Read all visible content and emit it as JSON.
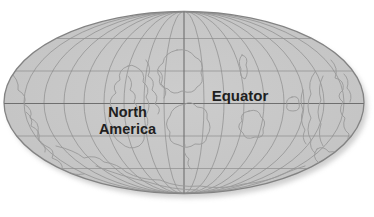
{
  "map": {
    "kind": "elliptical-projection-world-map",
    "labels": {
      "north_america_line1": "North",
      "north_america_line2": "America",
      "equator": "Equator"
    }
  },
  "colors": {
    "background": "#ffffff",
    "ocean_fill_center": "#cccccc",
    "ocean_fill_edge": "#c3c3c3",
    "edge_stroke": "#838383",
    "grid_line": "#8d8d8d",
    "grid_major": "#6f6f6f",
    "coastline": "#9a9a9a",
    "label_text": "#1f1f1f",
    "shadow": "#a8a8a8"
  },
  "geometry": {
    "width": 374,
    "height": 217,
    "cx": 184,
    "cy": 102.5,
    "rx": 180,
    "ry": 91,
    "equator_y": 103.5,
    "central_meridian_x": 184,
    "parallels_y": [
      38.5,
      71,
      136,
      168.5
    ],
    "meridians_per_side": 8,
    "shadow_dx": 3.5,
    "shadow_dy": 4.5
  },
  "coastlines": [
    {
      "name": "left-coast",
      "d": "M 8,70 Q 20,80 18,90 Q 28,96 24,104 Q 34,110 30,118 Q 40,122 38,132 Q 36,142 46,146 Q 56,150 52,158 Q 64,162 62,170 Q 72,176 84,174"
    },
    {
      "name": "left-inner-detail",
      "d": "M 26,112 Q 34,118 31,126 Q 41,130 39,140 Q 47,146 45,152"
    },
    {
      "name": "south-margin",
      "d": "M 56,146 Q 74,150 84,158 Q 96,154 104,162 Q 118,164 126,172 Q 140,180 160,180 Q 178,188 200,186 Q 222,190 244,184 Q 268,182 288,172 Q 298,168 305,166"
    },
    {
      "name": "south-margin-inner",
      "d": "M 96,166 Q 120,176 148,182 Q 172,190 198,190"
    },
    {
      "name": "laurentia-outline",
      "d": "M 128,66 Q 117,70 120,80 Q 111,85 116,93 Q 107,99 112,109 Q 105,119 113,127 Q 111,137 121,143 Q 129,151 139,146 Q 147,140 143,131 Q 151,124 146,115 Q 152,106 146,97 Q 151,88 143,82 Q 146,72 136,67 Q 132,64 128,66 Z"
    },
    {
      "name": "laurentia-inner-detail",
      "d": "M 128,76 Q 134,82 130,90 Q 138,94 134,102 Q 140,108 136,116"
    },
    {
      "name": "central-squiggle-1",
      "d": "M 146,60 Q 152,68 148,76 Q 156,80 152,90 Q 160,96 155,104 Q 162,108 158,114"
    },
    {
      "name": "central-squiggle-2",
      "d": "M 158,70 Q 165,74 161,84 Q 169,90 164,98"
    },
    {
      "name": "north-center-blob",
      "d": "M 177,50 Q 164,53 163,63 Q 154,69 160,77 Q 157,87 168,89 Q 173,96 182,91 Q 193,95 197,87 Q 205,83 201,73 Q 205,61 195,57 Q 189,48 177,50 Z"
    },
    {
      "name": "central-south-blob",
      "d": "M 185,104 Q 172,106 170,116 Q 163,124 170,132 Q 167,143 179,145 Q 187,150 195,144 Q 206,146 207,136 Q 213,127 207,119 Q 209,107 197,107 Q 191,100 185,104 Z"
    },
    {
      "name": "central-south-tail",
      "d": "M 185,145 Q 182,153 189,159 Q 186,165 191,169"
    },
    {
      "name": "island-center-right",
      "d": "M 249,111 Q 239,113 242,121 Q 235,127 243,133 Q 245,141 255,137 Q 265,139 263,129 Q 267,121 261,117 Q 259,108 249,111 Z"
    },
    {
      "name": "island-small-right",
      "d": "M 292,97 Q 285,99 287,105 Q 285,111 293,111 Q 301,111 299,103 Q 299,95 292,97 Z"
    },
    {
      "name": "islet-top-right",
      "d": "M 242,55 Q 237,61 241,69 Q 239,77 245,79 Q 249,73 246,65 Q 249,57 242,55 Z"
    },
    {
      "name": "island-arc-1",
      "d": "M 315,72 Q 307,82 311,94 Q 305,106 311,118 Q 305,130 311,140 Q 309,148 315,153"
    },
    {
      "name": "island-arc-2",
      "d": "M 323,76 Q 317,88 321,100 Q 315,112 321,124 Q 317,136 323,146"
    },
    {
      "name": "island-arc-3",
      "d": "M 303,90 Q 299,100 303,110 Q 299,120 305,130 Q 301,138 306,144"
    },
    {
      "name": "east-landmass",
      "d": "M 331,60 Q 339,68 335,78 Q 345,80 343,90 Q 335,96 343,102 Q 337,112 345,118 Q 341,128 349,134 Q 345,144 355,147 Q 361,150 364,142"
    },
    {
      "name": "east-inner-detail",
      "d": "M 344,74 Q 350,80 347,88 Q 353,94 350,102"
    },
    {
      "name": "southeast-blob",
      "d": "M 317,149 Q 311,157 319,163 Q 325,169 335,167 Q 346,167 344,158 Q 338,150 329,152 Q 323,145 317,149 Z"
    }
  ]
}
